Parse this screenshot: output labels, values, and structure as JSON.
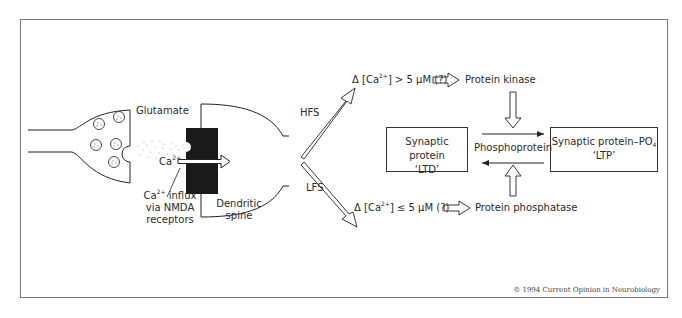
{
  "figure": {
    "synapse": {
      "neurotransmitter_label": "Glutamate",
      "ion_label": "Ca",
      "ion_charge": "2+",
      "influx_label": {
        "ion": "Ca",
        "charge": "2+",
        "line1_rest": " influx",
        "line2": "via NMDA",
        "line3": "receptors"
      },
      "spine_label": {
        "line1": "Dendritic",
        "line2": "spine"
      }
    },
    "pathways": {
      "hfs": {
        "label": "HFS",
        "condition_prefix": "Δ [Ca",
        "condition_charge": "2+",
        "condition_suffix": "] > 5 μM (?)",
        "enzyme": "Protein kinase"
      },
      "lfs": {
        "label": "LFS",
        "condition_prefix": "Δ [Ca",
        "condition_charge": "2+",
        "condition_suffix": "] ≤ 5 μM (?)",
        "enzyme": "Protein phosphatase"
      }
    },
    "states": {
      "ltd_box": {
        "line1": "Synaptic protein",
        "line2": "‘LTD’"
      },
      "center_label": "Phosphoprotein",
      "ltp_box": {
        "line1_main": "Synaptic protein–PO",
        "line1_sub": "4",
        "line2": "‘LTP’"
      }
    },
    "copyright": "© 1994 Current Opinion in Neurobiology"
  }
}
